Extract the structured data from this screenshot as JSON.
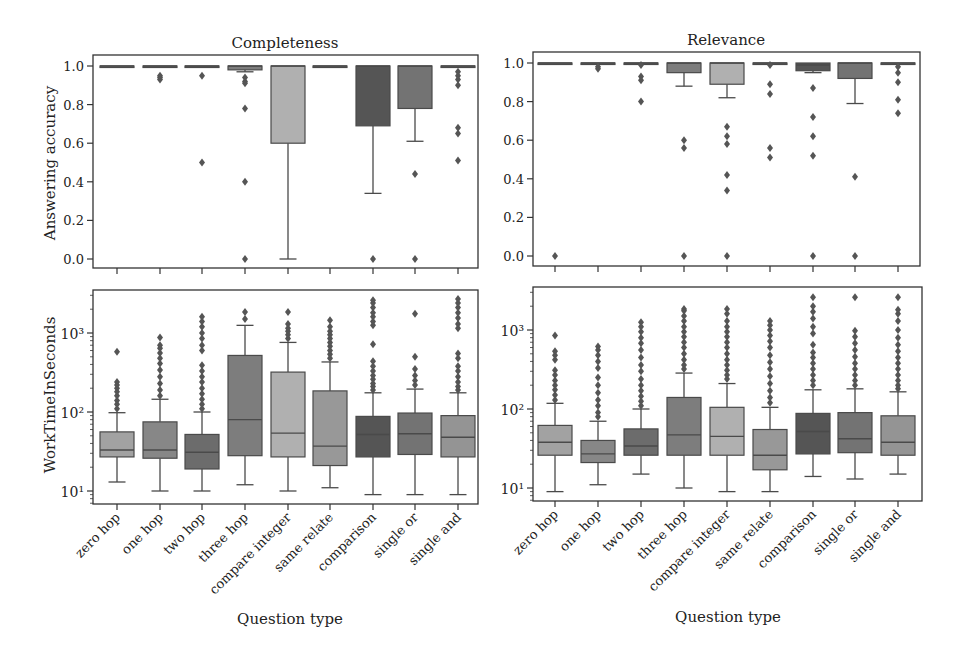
{
  "figure": {
    "xlabel": "Question type",
    "box_colors": [
      "#a2a2a2",
      "#878787",
      "#6c6c6c",
      "#7d7d7d",
      "#b0b0b0",
      "#989898",
      "#555555",
      "#737373",
      "#949494"
    ],
    "outlier_color": "#555555",
    "edge_color": "#4a4a4a"
  },
  "chart_data": [
    {
      "type": "box",
      "title": "Completeness",
      "xlabel": "",
      "ylabel": "Answering accuracy",
      "yscale": "linear",
      "ylim": [
        -0.03,
        1.04
      ],
      "yticks": [
        0.0,
        0.2,
        0.4,
        0.6,
        0.8,
        1.0
      ],
      "ytick_labels": [
        "0.0",
        "0.2",
        "0.4",
        "0.6",
        "0.8",
        "1.0"
      ],
      "categories": [
        "zero hop",
        "one hop",
        "two hop",
        "three hop",
        "compare integer",
        "same relate",
        "comparison",
        "single or",
        "single and"
      ],
      "boxes": [
        {
          "q1": 1.0,
          "median": 1.0,
          "q3": 1.0,
          "whislo": 1.0,
          "whishi": 1.0,
          "fliers": []
        },
        {
          "q1": 1.0,
          "median": 1.0,
          "q3": 1.0,
          "whislo": 1.0,
          "whishi": 1.0,
          "fliers": [
            0.95,
            0.94,
            0.93
          ]
        },
        {
          "q1": 1.0,
          "median": 1.0,
          "q3": 1.0,
          "whislo": 1.0,
          "whishi": 1.0,
          "fliers": [
            0.95,
            0.5
          ]
        },
        {
          "q1": 0.98,
          "median": 1.0,
          "q3": 1.0,
          "whislo": 0.97,
          "whishi": 1.0,
          "fliers": [
            0.94,
            0.92,
            0.91,
            0.78,
            0.4,
            0.0
          ]
        },
        {
          "q1": 0.6,
          "median": 1.0,
          "q3": 1.0,
          "whislo": 0.0,
          "whishi": 1.0,
          "fliers": []
        },
        {
          "q1": 1.0,
          "median": 1.0,
          "q3": 1.0,
          "whislo": 1.0,
          "whishi": 1.0,
          "fliers": []
        },
        {
          "q1": 0.69,
          "median": 1.0,
          "q3": 1.0,
          "whislo": 0.34,
          "whishi": 1.0,
          "fliers": [
            0.0
          ]
        },
        {
          "q1": 0.78,
          "median": 1.0,
          "q3": 1.0,
          "whislo": 0.61,
          "whishi": 1.0,
          "fliers": [
            0.44,
            0.0
          ]
        },
        {
          "q1": 1.0,
          "median": 1.0,
          "q3": 1.0,
          "whislo": 1.0,
          "whishi": 1.0,
          "fliers": [
            0.97,
            0.95,
            0.93,
            0.9,
            0.68,
            0.65,
            0.51
          ]
        }
      ]
    },
    {
      "type": "box",
      "title": "Relevance",
      "xlabel": "",
      "ylabel": "",
      "yscale": "linear",
      "ylim": [
        -0.03,
        1.04
      ],
      "yticks": [
        0.0,
        0.2,
        0.4,
        0.6,
        0.8,
        1.0
      ],
      "ytick_labels": [
        "0.0",
        "0.2",
        "0.4",
        "0.6",
        "0.8",
        "1.0"
      ],
      "categories": [
        "zero hop",
        "one hop",
        "two hop",
        "three hop",
        "compare integer",
        "same relate",
        "comparison",
        "single or",
        "single and"
      ],
      "boxes": [
        {
          "q1": 1.0,
          "median": 1.0,
          "q3": 1.0,
          "whislo": 1.0,
          "whishi": 1.0,
          "fliers": [
            0.0
          ]
        },
        {
          "q1": 1.0,
          "median": 1.0,
          "q3": 1.0,
          "whislo": 1.0,
          "whishi": 1.0,
          "fliers": [
            0.98,
            0.97
          ]
        },
        {
          "q1": 1.0,
          "median": 1.0,
          "q3": 1.0,
          "whislo": 1.0,
          "whishi": 1.0,
          "fliers": [
            0.99,
            0.93,
            0.91,
            0.8
          ]
        },
        {
          "q1": 0.95,
          "median": 1.0,
          "q3": 1.0,
          "whislo": 0.88,
          "whishi": 1.0,
          "fliers": [
            0.6,
            0.56,
            0.0
          ]
        },
        {
          "q1": 0.89,
          "median": 1.0,
          "q3": 1.0,
          "whislo": 0.82,
          "whishi": 1.0,
          "fliers": [
            0.67,
            0.62,
            0.58,
            0.42,
            0.34,
            0.0
          ]
        },
        {
          "q1": 1.0,
          "median": 1.0,
          "q3": 1.0,
          "whislo": 1.0,
          "whishi": 1.0,
          "fliers": [
            0.99,
            0.89,
            0.84,
            0.56,
            0.51
          ]
        },
        {
          "q1": 0.96,
          "median": 0.99,
          "q3": 1.0,
          "whislo": 0.95,
          "whishi": 1.0,
          "fliers": [
            0.87,
            0.72,
            0.62,
            0.52,
            0.0
          ]
        },
        {
          "q1": 0.92,
          "median": 1.0,
          "q3": 1.0,
          "whislo": 0.79,
          "whishi": 1.0,
          "fliers": [
            0.41,
            0.0
          ]
        },
        {
          "q1": 1.0,
          "median": 1.0,
          "q3": 1.0,
          "whislo": 1.0,
          "whishi": 1.0,
          "fliers": [
            0.98,
            0.95,
            0.9,
            0.81,
            0.74
          ]
        }
      ]
    },
    {
      "type": "box",
      "title": "",
      "xlabel": "Question type",
      "ylabel": "WorkTimeInSeconds",
      "yscale": "log",
      "ylim": [
        7,
        3500
      ],
      "yticks": [
        10,
        100,
        1000
      ],
      "ytick_labels": [
        "10¹",
        "10²",
        "10³"
      ],
      "categories": [
        "zero hop",
        "one hop",
        "two hop",
        "three hop",
        "compare integer",
        "same relate",
        "comparison",
        "single or",
        "single and"
      ],
      "boxes": [
        {
          "q1": 27,
          "median": 33,
          "q3": 56,
          "whislo": 13,
          "whishi": 98,
          "fliers": [
            110,
            125,
            140,
            160,
            180,
            200,
            220,
            240,
            580
          ]
        },
        {
          "q1": 26,
          "median": 33,
          "q3": 75,
          "whislo": 10,
          "whishi": 145,
          "fliers": [
            160,
            190,
            230,
            280,
            340,
            410,
            480,
            560,
            640,
            700,
            880
          ]
        },
        {
          "q1": 19,
          "median": 31,
          "q3": 52,
          "whislo": 10,
          "whishi": 100,
          "fliers": [
            110,
            125,
            145,
            170,
            200,
            240,
            280,
            330,
            390,
            600,
            700,
            850,
            1000,
            1200,
            1400,
            1600
          ]
        },
        {
          "q1": 28,
          "median": 80,
          "q3": 520,
          "whislo": 12,
          "whishi": 1250,
          "fliers": [
            1500,
            1850
          ]
        },
        {
          "q1": 27,
          "median": 54,
          "q3": 320,
          "whislo": 10,
          "whishi": 760,
          "fliers": [
            850,
            950,
            1050,
            1150,
            1300,
            1850
          ]
        },
        {
          "q1": 21,
          "median": 37,
          "q3": 185,
          "whislo": 11,
          "whishi": 430,
          "fliers": [
            480,
            540,
            600,
            680,
            760,
            850,
            950,
            1050,
            1200,
            1450
          ]
        },
        {
          "q1": 27,
          "median": 52,
          "q3": 88,
          "whislo": 9,
          "whishi": 175,
          "fliers": [
            190,
            210,
            230,
            260,
            290,
            330,
            380,
            440,
            720,
            1250,
            1400,
            1600,
            1800,
            2100,
            2400,
            2600
          ]
        },
        {
          "q1": 29,
          "median": 53,
          "q3": 97,
          "whislo": 9,
          "whishi": 195,
          "fliers": [
            220,
            250,
            290,
            350,
            500,
            1750
          ]
        },
        {
          "q1": 27,
          "median": 48,
          "q3": 90,
          "whislo": 9,
          "whishi": 175,
          "fliers": [
            190,
            210,
            240,
            280,
            330,
            380,
            480,
            550,
            1150,
            1300,
            1550,
            1800,
            2100,
            2400,
            2700
          ]
        }
      ]
    },
    {
      "type": "box",
      "title": "",
      "xlabel": "Question type",
      "ylabel": "",
      "yscale": "log",
      "ylim": [
        7,
        3500
      ],
      "yticks": [
        10,
        100,
        1000
      ],
      "ytick_labels": [
        "10¹",
        "10²",
        "10³"
      ],
      "categories": [
        "zero hop",
        "one hop",
        "two hop",
        "three hop",
        "compare integer",
        "same relate",
        "comparison",
        "single or",
        "single and"
      ],
      "boxes": [
        {
          "q1": 26,
          "median": 38,
          "q3": 62,
          "whislo": 9,
          "whishi": 118,
          "fliers": [
            130,
            150,
            175,
            200,
            230,
            270,
            310,
            420,
            480,
            540,
            850
          ]
        },
        {
          "q1": 21,
          "median": 27,
          "q3": 40,
          "whislo": 11,
          "whishi": 70,
          "fliers": [
            80,
            90,
            110,
            130,
            160,
            200,
            250,
            330,
            400,
            480,
            560,
            620
          ]
        },
        {
          "q1": 26,
          "median": 34,
          "q3": 56,
          "whislo": 15,
          "whishi": 100,
          "fliers": [
            110,
            125,
            145,
            170,
            200,
            240,
            300,
            360,
            450,
            560,
            680,
            800,
            950,
            1100,
            1250
          ]
        },
        {
          "q1": 26,
          "median": 47,
          "q3": 140,
          "whislo": 10,
          "whishi": 285,
          "fliers": [
            320,
            360,
            420,
            500,
            600,
            700,
            820,
            950,
            1100,
            1300,
            1500,
            1750,
            1850
          ]
        },
        {
          "q1": 26,
          "median": 45,
          "q3": 105,
          "whislo": 9,
          "whishi": 210,
          "fliers": [
            240,
            270,
            310,
            360,
            420,
            500,
            600,
            700,
            820,
            950,
            1100,
            1300,
            1600,
            1850
          ]
        },
        {
          "q1": 17,
          "median": 26,
          "q3": 55,
          "whislo": 9,
          "whishi": 105,
          "fliers": [
            120,
            140,
            170,
            210,
            260,
            320,
            390,
            480,
            600,
            720,
            850,
            1000,
            1150,
            1300
          ]
        },
        {
          "q1": 27,
          "median": 52,
          "q3": 88,
          "whislo": 14,
          "whishi": 175,
          "fliers": [
            200,
            230,
            270,
            320,
            380,
            450,
            520,
            650,
            900,
            1100,
            1400,
            1700,
            2000,
            2600
          ]
        },
        {
          "q1": 28,
          "median": 42,
          "q3": 90,
          "whislo": 13,
          "whishi": 180,
          "fliers": [
            200,
            230,
            270,
            320,
            380,
            460,
            560,
            680,
            820,
            980,
            2600
          ]
        },
        {
          "q1": 26,
          "median": 38,
          "q3": 82,
          "whislo": 15,
          "whishi": 165,
          "fliers": [
            180,
            200,
            230,
            270,
            320,
            380,
            450,
            540,
            650,
            800,
            1000,
            1300,
            1600,
            1800,
            2600
          ]
        }
      ]
    }
  ]
}
